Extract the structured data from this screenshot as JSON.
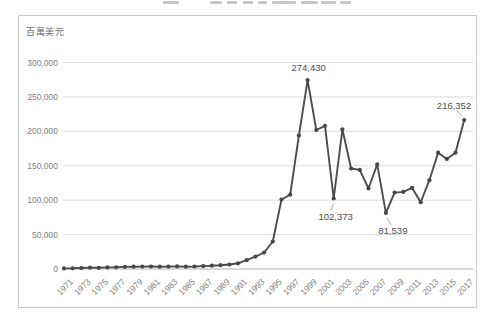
{
  "chart": {
    "unit_label": "百萬美元"
  },
  "chart_data": {
    "type": "line",
    "ylabel": "百萬美元",
    "ylim": [
      0,
      300000
    ],
    "grid": true,
    "legend": "none",
    "x": [
      1971,
      1972,
      1973,
      1974,
      1975,
      1976,
      1977,
      1978,
      1979,
      1980,
      1981,
      1982,
      1983,
      1984,
      1985,
      1986,
      1987,
      1988,
      1989,
      1990,
      1991,
      1992,
      1993,
      1994,
      1995,
      1996,
      1997,
      1998,
      1999,
      2000,
      2001,
      2002,
      2003,
      2004,
      2005,
      2006,
      2007,
      2008,
      2009,
      2010,
      2011,
      2012,
      2013,
      2014,
      2015,
      2016,
      2017
    ],
    "values": [
      800,
      1000,
      1500,
      2000,
      1800,
      2300,
      2500,
      3000,
      3300,
      3500,
      3600,
      3300,
      3500,
      3800,
      3400,
      3700,
      4200,
      4800,
      5500,
      6500,
      8300,
      13000,
      18000,
      24000,
      40000,
      101000,
      108000,
      194000,
      274430,
      202000,
      208000,
      102373,
      203000,
      146000,
      144000,
      117000,
      152000,
      81539,
      111000,
      112000,
      118000,
      97000,
      129000,
      169000,
      160000,
      169000,
      216352
    ],
    "y_ticks": [
      {
        "value": 0,
        "label": "0"
      },
      {
        "value": 50000,
        "label": "50,000"
      },
      {
        "value": 100000,
        "label": "100,000"
      },
      {
        "value": 150000,
        "label": "150,000"
      },
      {
        "value": 200000,
        "label": "200,000"
      },
      {
        "value": 250000,
        "label": "250,000"
      },
      {
        "value": 300000,
        "label": "300,000"
      }
    ],
    "x_tick_labels": [
      "1971",
      "1973",
      "1975",
      "1977",
      "1979",
      "1981",
      "1983",
      "1985",
      "1987",
      "1989",
      "1991",
      "1993",
      "1995",
      "1997",
      "1999",
      "2001",
      "2003",
      "2005",
      "2007",
      "2009",
      "2011",
      "2013",
      "2015",
      "2017"
    ],
    "annotations": [
      {
        "year": 1999,
        "value": 274430,
        "label": "274,430",
        "anchor": "middle",
        "dx": 1,
        "dy": -9,
        "leader": null
      },
      {
        "year": 2002,
        "value": 102373,
        "label": "102,373",
        "anchor": "middle",
        "dx": 2,
        "dy": 21,
        "leader": [
          0,
          5,
          -3,
          12
        ]
      },
      {
        "year": 2008,
        "value": 81539,
        "label": "81,539",
        "anchor": "middle",
        "dx": 7,
        "dy": 21,
        "leader": [
          1,
          5,
          5,
          12
        ]
      },
      {
        "year": 2017,
        "value": 216352,
        "label": "216,352",
        "anchor": "end",
        "dx": 7,
        "dy": -11,
        "leader": [
          -2,
          -4,
          -7,
          -9
        ]
      }
    ],
    "colors": {
      "line": "#4d4d4d",
      "marker": "#474747",
      "grid": "#dcdcdc",
      "axis": "#b3b3b3",
      "tick_text": "#7f7f7f",
      "annotation_text": "#4d4d4d",
      "leader": "#a6a6a6",
      "border": "#c9c9c9",
      "background": "#ffffff"
    }
  }
}
